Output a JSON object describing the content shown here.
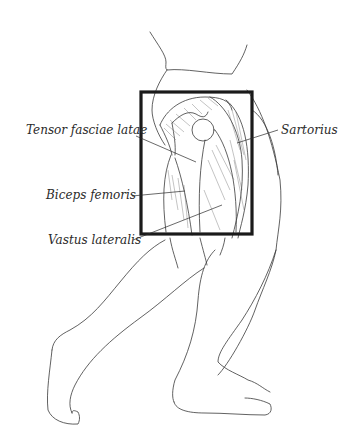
{
  "figure": {
    "highlight_box": {
      "x": 141,
      "y": 92,
      "width": 111,
      "height": 142,
      "stroke": "#1a1a1a"
    },
    "line_color": "#3a3a3a"
  },
  "labels": [
    {
      "id": "tensor",
      "text": "Tensor fasciae latae",
      "x": 26,
      "y": 124,
      "leader": [
        [
          144,
          136
        ],
        [
          196,
          162
        ]
      ]
    },
    {
      "id": "sartorius",
      "text": "Sartorius",
      "x": 281,
      "y": 124,
      "leader": [
        [
          278,
          130
        ],
        [
          237,
          143
        ]
      ]
    },
    {
      "id": "biceps",
      "text": "Biceps femoris",
      "x": 46,
      "y": 189,
      "leader": [
        [
          132,
          196
        ],
        [
          185,
          191
        ]
      ]
    },
    {
      "id": "vastus",
      "text": "Vastus lateralis",
      "x": 48,
      "y": 234,
      "leader": [
        [
          133,
          240
        ],
        [
          222,
          205
        ]
      ]
    }
  ]
}
